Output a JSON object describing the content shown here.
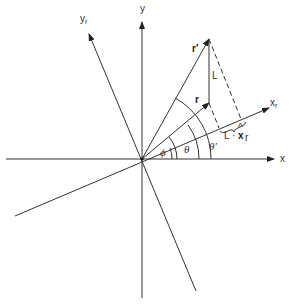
{
  "diagram": {
    "type": "vector rotation diagram",
    "axes": {
      "x": "x",
      "y": "y",
      "x_rotated": "x",
      "x_rotated_sub": "r",
      "y_rotated": "y",
      "y_rotated_sub": "r"
    },
    "vectors": {
      "r": "r",
      "r_prime": "r′",
      "L": "L"
    },
    "angles": {
      "phi": "ϕ",
      "theta": "θ",
      "theta_prime": "θ′"
    },
    "projection_label": {
      "L": "L",
      "dot": "·",
      "xhat": "x",
      "hat": "^",
      "sub": "r"
    },
    "colors": {
      "line": "#333333",
      "background": "#ffffff"
    }
  }
}
